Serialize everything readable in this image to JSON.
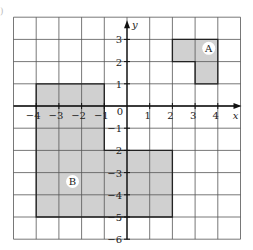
{
  "diagram": {
    "type": "coordinate-grid",
    "grid": {
      "x_min": -5,
      "x_max": 5,
      "y_min": -6,
      "y_max": 4,
      "cell_px_x": 22.7,
      "cell_px_y": 22.2,
      "origin_px": [
        127,
        106
      ],
      "line_color": "#555555"
    },
    "axes": {
      "x_label": "x",
      "y_label": "y",
      "x_ticks": [
        {
          "value": -4,
          "label": "-4"
        },
        {
          "value": -3,
          "label": "-3"
        },
        {
          "value": -2,
          "label": "-2"
        },
        {
          "value": -1,
          "label": "-1"
        },
        {
          "value": 1,
          "label": "1"
        },
        {
          "value": 2,
          "label": "2"
        },
        {
          "value": 3,
          "label": "3"
        },
        {
          "value": 4,
          "label": "4"
        }
      ],
      "y_ticks": [
        {
          "value": 3,
          "label": "3"
        },
        {
          "value": 2,
          "label": "2"
        },
        {
          "value": 1,
          "label": "1"
        },
        {
          "value": -1,
          "label": "-1"
        },
        {
          "value": -2,
          "label": "-2"
        },
        {
          "value": -3,
          "label": "-3"
        },
        {
          "value": -4,
          "label": "-4"
        },
        {
          "value": -5,
          "label": "-5"
        },
        {
          "value": -6,
          "label": "-6"
        }
      ],
      "origin_label": "0"
    },
    "shapes": [
      {
        "name": "A",
        "label": "A",
        "fill": "#d0d0d0",
        "vertices": [
          [
            2,
            3
          ],
          [
            4,
            3
          ],
          [
            4,
            1
          ],
          [
            3,
            1
          ],
          [
            3,
            2
          ],
          [
            2,
            2
          ]
        ],
        "label_at": [
          3.6,
          2.6
        ]
      },
      {
        "name": "B",
        "label": "B",
        "fill": "#d0d0d0",
        "vertices": [
          [
            -4,
            1
          ],
          [
            -1,
            1
          ],
          [
            -1,
            -2
          ],
          [
            2,
            -2
          ],
          [
            2,
            -5
          ],
          [
            -4,
            -5
          ]
        ],
        "label_at": [
          -2.4,
          -3.4
        ]
      }
    ]
  }
}
